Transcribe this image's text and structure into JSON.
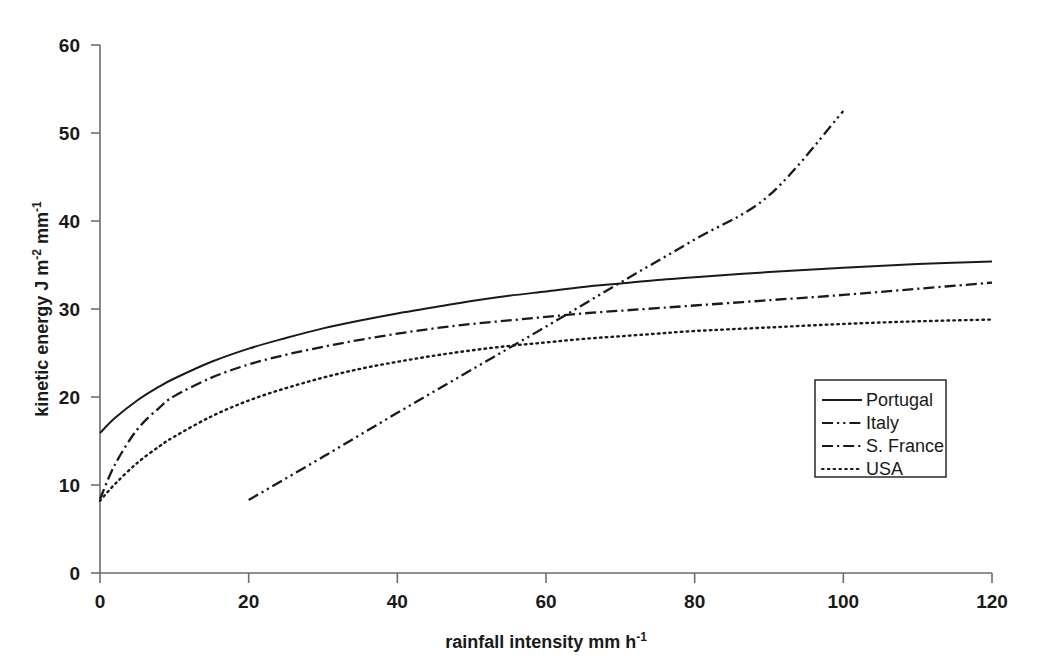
{
  "chart_data": {
    "type": "line",
    "title": "",
    "xlabel": "rainfall intensity  mm h-1",
    "xlabel_base": "rainfall intensity  mm h",
    "xlabel_sup": "-1",
    "ylabel": "kinetic energy  J m-2 mm-1",
    "ylabel_part1": "kinetic energy  J m",
    "ylabel_sup1": "-2",
    "ylabel_part2": " mm",
    "ylabel_sup2": "-1",
    "xlim": [
      0,
      120
    ],
    "ylim": [
      0,
      60
    ],
    "xticks": [
      0,
      20,
      40,
      60,
      80,
      100,
      120
    ],
    "xtick_labels": [
      "0",
      "20",
      "40",
      "60",
      "80",
      "100",
      "120"
    ],
    "yticks": [
      0,
      10,
      20,
      30,
      40,
      50,
      60
    ],
    "ytick_labels": [
      "0",
      "10",
      "20",
      "30",
      "40",
      "50",
      "60"
    ],
    "grid": false,
    "legend_position": "lower-right",
    "series": [
      {
        "name": "Portugal",
        "style": "solid",
        "x": [
          0,
          2,
          5,
          8,
          10,
          15,
          20,
          25,
          30,
          35,
          40,
          45,
          50,
          55,
          60,
          65,
          70,
          75,
          80,
          90,
          100,
          110,
          120
        ],
        "y": [
          15.9,
          17.6,
          19.6,
          21.2,
          22.1,
          24.0,
          25.5,
          26.7,
          27.8,
          28.7,
          29.5,
          30.2,
          30.9,
          31.5,
          32.0,
          32.5,
          32.9,
          33.3,
          33.6,
          34.2,
          34.7,
          35.1,
          35.4
        ]
      },
      {
        "name": "Italy",
        "style": "dash-dot-dot",
        "x": [
          20,
          30,
          40,
          50,
          60,
          70,
          80,
          90,
          100
        ],
        "y": [
          8.3,
          13.2,
          18.2,
          23.1,
          28.0,
          33.0,
          37.9,
          42.9,
          52.5
        ]
      },
      {
        "name": "S. France",
        "style": "dash-dot",
        "x": [
          0,
          2,
          5,
          8,
          10,
          15,
          20,
          25,
          30,
          35,
          40,
          45,
          50,
          55,
          60,
          65,
          70,
          75,
          80,
          90,
          100,
          110,
          120
        ],
        "y": [
          8.4,
          12.3,
          16.3,
          18.8,
          20.1,
          22.2,
          23.7,
          24.8,
          25.7,
          26.5,
          27.2,
          27.8,
          28.3,
          28.7,
          29.1,
          29.5,
          29.8,
          30.1,
          30.4,
          31.0,
          31.6,
          32.3,
          33.0
        ]
      },
      {
        "name": "USA",
        "style": "dotted",
        "x": [
          0,
          2,
          5,
          8,
          10,
          15,
          20,
          25,
          30,
          35,
          40,
          45,
          50,
          55,
          60,
          65,
          70,
          75,
          80,
          90,
          100,
          110,
          120
        ],
        "y": [
          8.2,
          10.1,
          12.5,
          14.4,
          15.5,
          17.8,
          19.6,
          21.0,
          22.2,
          23.2,
          24.0,
          24.7,
          25.3,
          25.8,
          26.2,
          26.6,
          26.9,
          27.2,
          27.5,
          27.9,
          28.3,
          28.6,
          28.8
        ]
      }
    ]
  },
  "legend": {
    "items": [
      {
        "label": "Portugal",
        "style": "solid"
      },
      {
        "label": "Italy",
        "style": "dash-dot-dot"
      },
      {
        "label": "S. France",
        "style": "dash-dot"
      },
      {
        "label": "USA",
        "style": "dotted"
      }
    ]
  },
  "colors": {
    "line": "#1a1a1a",
    "axis": "#6d6d6d",
    "background": "#ffffff"
  }
}
